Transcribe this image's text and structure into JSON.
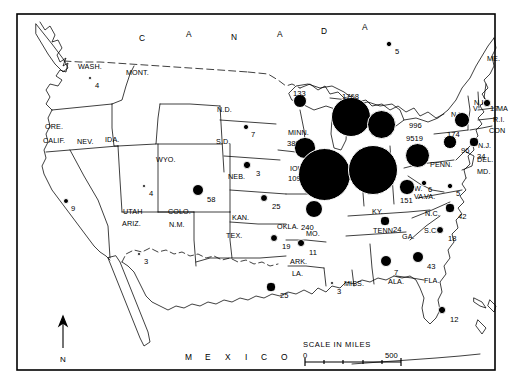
{
  "figure": {
    "border_color": "#000000",
    "dot_color": "#000000",
    "background": "#ffffff"
  },
  "country_labels": [
    {
      "text": "C",
      "x": 139,
      "y": 33
    },
    {
      "text": "A",
      "x": 186,
      "y": 29
    },
    {
      "text": "N",
      "x": 231,
      "y": 32
    },
    {
      "text": "A",
      "x": 277,
      "y": 29
    },
    {
      "text": "D",
      "x": 321,
      "y": 26
    },
    {
      "text": "A",
      "x": 362,
      "y": 22
    },
    {
      "text": "M",
      "x": 185,
      "y": 352
    },
    {
      "text": "E",
      "x": 205,
      "y": 352
    },
    {
      "text": "X",
      "x": 225,
      "y": 352
    },
    {
      "text": "I",
      "x": 245,
      "y": 352
    },
    {
      "text": "C",
      "x": 261,
      "y": 352
    },
    {
      "text": "O",
      "x": 281,
      "y": 352
    }
  ],
  "state_labels": [
    {
      "name": "WASH.",
      "text": "WASH.",
      "x": 78,
      "y": 62
    },
    {
      "name": "MONT.",
      "text": "MONT.",
      "x": 126,
      "y": 68
    },
    {
      "name": "ORE.",
      "text": "ORE.",
      "x": 45,
      "y": 122
    },
    {
      "name": "IDA.",
      "text": "IDA.",
      "x": 105,
      "y": 135
    },
    {
      "name": "CALIF.",
      "text": "CALIF.",
      "x": 43,
      "y": 136
    },
    {
      "name": "NEV.",
      "text": "NEV.",
      "x": 77,
      "y": 137
    },
    {
      "name": "WYO.",
      "text": "WYO.",
      "x": 156,
      "y": 155
    },
    {
      "name": "N.D.",
      "text": "N.D.",
      "x": 217,
      "y": 105
    },
    {
      "name": "S.D.",
      "text": "S.D.",
      "x": 216,
      "y": 137
    },
    {
      "name": "NEB.",
      "text": "NEB.",
      "x": 228,
      "y": 172
    },
    {
      "name": "UTAH",
      "text": "UTAH",
      "x": 123,
      "y": 207
    },
    {
      "name": "ARIZ.",
      "text": "ARIZ.",
      "x": 122,
      "y": 219
    },
    {
      "name": "COLO.",
      "text": "COLO.",
      "x": 168,
      "y": 207
    },
    {
      "name": "N.M.",
      "text": "N.M.",
      "x": 169,
      "y": 220
    },
    {
      "name": "KAN.",
      "text": "KAN.",
      "x": 232,
      "y": 213
    },
    {
      "name": "TEX.",
      "text": "TEX.",
      "x": 226,
      "y": 231
    },
    {
      "name": "OKLA.",
      "text": "OKLA.",
      "x": 277,
      "y": 222
    },
    {
      "name": "ARK.",
      "text": "ARK.",
      "x": 290,
      "y": 257
    },
    {
      "name": "LA.",
      "text": "LA.",
      "x": 292,
      "y": 269
    },
    {
      "name": "MISS.",
      "text": "MISS.",
      "x": 344,
      "y": 279
    },
    {
      "name": "ALA.",
      "text": "ALA.",
      "x": 388,
      "y": 277
    },
    {
      "name": "MO.",
      "text": "MO.",
      "x": 306,
      "y": 229
    },
    {
      "name": "MINN.",
      "text": "MINN.",
      "x": 288,
      "y": 128
    },
    {
      "name": "IOWA",
      "text": "IOWA",
      "x": 290,
      "y": 164
    },
    {
      "name": "TENN.",
      "text": "TENN.",
      "x": 373,
      "y": 226
    },
    {
      "name": "KY.",
      "text": "KY.",
      "x": 372,
      "y": 207
    },
    {
      "name": "GA.",
      "text": "GA.",
      "x": 402,
      "y": 232
    },
    {
      "name": "FLA.",
      "text": "FLA.",
      "x": 424,
      "y": 276
    },
    {
      "name": "S.C.",
      "text": "S.C.",
      "x": 424,
      "y": 226
    },
    {
      "name": "N.C.",
      "text": "N.C.",
      "x": 425,
      "y": 209
    },
    {
      "name": "VA.",
      "text": "VA.",
      "x": 424,
      "y": 192
    },
    {
      "name": "W.VA-W",
      "text": "W.",
      "x": 414,
      "y": 184
    },
    {
      "name": "W.VA-VA",
      "text": "VA.",
      "x": 414,
      "y": 192
    },
    {
      "name": "PENN.",
      "text": "PENN.",
      "x": 430,
      "y": 160
    },
    {
      "name": "N.Y.",
      "text": "N.Y.",
      "x": 451,
      "y": 110
    },
    {
      "name": "N.H.",
      "text": "N.H.",
      "x": 474,
      "y": 98
    },
    {
      "name": "MASS.",
      "text": "MA",
      "x": 497,
      "y": 104
    },
    {
      "name": "R.I.",
      "text": "R.I.",
      "x": 493,
      "y": 115
    },
    {
      "name": "CONN.",
      "text": "CON",
      "x": 489,
      "y": 126
    },
    {
      "name": "N.J.",
      "text": "N.J.",
      "x": 478,
      "y": 141
    },
    {
      "name": "DEL.",
      "text": "DEL.",
      "x": 477,
      "y": 155
    },
    {
      "name": "MD.",
      "text": "MD.",
      "x": 477,
      "y": 167
    },
    {
      "name": "VT.",
      "text": "V",
      "x": 473,
      "y": 104
    },
    {
      "name": "ME.",
      "text": "ME.",
      "x": 487,
      "y": 54
    }
  ],
  "data_points": [
    {
      "state": "WASH.",
      "value": 4,
      "cx": 90,
      "cy": 78,
      "r": 2.4,
      "lx": 95,
      "ly": 81
    },
    {
      "state": "CALIF.",
      "value": 9,
      "cx": 66,
      "cy": 201,
      "r": 3.0,
      "lx": 71,
      "ly": 204
    },
    {
      "state": "IDA.",
      "value": 4,
      "cx": 144,
      "cy": 186,
      "r": 2.4,
      "lx": 149,
      "ly": 189
    },
    {
      "state": "ARIZ.",
      "value": 3,
      "cx": 139,
      "cy": 254,
      "r": 2.2,
      "lx": 144,
      "ly": 257
    },
    {
      "state": "COLO.",
      "value": 58,
      "cx": 198,
      "cy": 190,
      "r": 6.4,
      "lx": 207,
      "ly": 195
    },
    {
      "state": "S.D.",
      "value": 7,
      "cx": 246,
      "cy": 127,
      "r": 2.8,
      "lx": 251,
      "ly": 130
    },
    {
      "state": "NEB.",
      "value": 3,
      "cx": 247,
      "cy": 165,
      "r": 3.6,
      "lx": 256,
      "ly": 169
    },
    {
      "state": "KAN.",
      "value": 25,
      "cx": 264,
      "cy": 198,
      "r": 4.4,
      "lx": 272,
      "ly": 202
    },
    {
      "state": "OKLA.",
      "value": 19,
      "cx": 274,
      "cy": 238,
      "r": 4.0,
      "lx": 282,
      "ly": 242
    },
    {
      "state": "TEX.",
      "value": 25,
      "cx": 271,
      "cy": 287,
      "r": 4.6,
      "lx": 280,
      "ly": 291
    },
    {
      "state": "ARK.",
      "value": 11,
      "cx": 301,
      "cy": 243,
      "r": 3.8,
      "lx": 309,
      "ly": 248
    },
    {
      "state": "MISS.",
      "value": 3,
      "cx": 332,
      "cy": 283,
      "r": 2.2,
      "lx": 337,
      "ly": 287
    },
    {
      "state": "ALA.",
      "value": 7,
      "cx": 386,
      "cy": 261,
      "r": 6.0,
      "lx": 394,
      "ly": 268
    },
    {
      "state": "GA.",
      "value": 43,
      "cx": 418,
      "cy": 257,
      "r": 6.2,
      "lx": 427,
      "ly": 262
    },
    {
      "state": "S.C.",
      "value": 18,
      "cx": 440,
      "cy": 230,
      "r": 4.4,
      "lx": 448,
      "ly": 234
    },
    {
      "state": "N.C.",
      "value": 42,
      "cx": 450,
      "cy": 208,
      "r": 4.6,
      "lx": 458,
      "ly": 212
    },
    {
      "state": "FLA.",
      "value": 12,
      "cx": 442,
      "cy": 310,
      "r": 3.6,
      "lx": 450,
      "ly": 315
    },
    {
      "state": "TENN.",
      "value": 24,
      "cx": 385,
      "cy": 221,
      "r": 4.6,
      "lx": 393,
      "ly": 225
    },
    {
      "state": "MO.",
      "value": 240,
      "cx": 314,
      "cy": 209,
      "r": 9.0,
      "lx": 301,
      "ly": 223
    },
    {
      "state": "MINN.",
      "value": 389,
      "cx": 305,
      "cy": 148,
      "r": 10.6,
      "lx": 287,
      "ly": 139
    },
    {
      "state": "IOWA",
      "value": 10994,
      "cx": 324,
      "cy": 174,
      "r": 26.5,
      "lx": 288,
      "ly": 174
    },
    {
      "state": "WIS-N",
      "value": 133,
      "cx": 300,
      "cy": 101,
      "r": 7.2,
      "lx": 293,
      "ly": 89
    },
    {
      "state": "WIS",
      "value": 1768,
      "cx": 351,
      "cy": 117,
      "r": 20.0,
      "lx": 342,
      "ly": 92
    },
    {
      "state": "MICH",
      "value": 996,
      "cx": 381,
      "cy": 124,
      "r": 14.5,
      "lx": 409,
      "ly": 121
    },
    {
      "state": "OHIO",
      "value": 9519,
      "cx": 373,
      "cy": 170,
      "r": 25.0,
      "lx": 406,
      "ly": 134
    },
    {
      "state": "IND",
      "value": 741,
      "cx": 417,
      "cy": 155,
      "r": 12.5,
      "lx": 412,
      "ly": 145
    },
    {
      "state": "KY.",
      "value": 151,
      "cx": 407,
      "cy": 187,
      "r": 7.6,
      "lx": 400,
      "ly": 196
    },
    {
      "state": "W.VA.",
      "value": 6,
      "cx": 424,
      "cy": 183,
      "r": 2.6,
      "lx": 428,
      "ly": 185
    },
    {
      "state": "VA.",
      "value": 5,
      "cx": 450,
      "cy": 186,
      "r": 2.6,
      "lx": 456,
      "ly": 189
    },
    {
      "state": "PENN.",
      "value": 96,
      "cx": 450,
      "cy": 142,
      "r": 6.6,
      "lx": 461,
      "ly": 146
    },
    {
      "state": "N.Y.",
      "value": 174,
      "cx": 462,
      "cy": 120,
      "r": 7.8,
      "lx": 447,
      "ly": 130
    },
    {
      "state": "N.J.",
      "value": 34,
      "cx": 474,
      "cy": 142,
      "r": 4.6,
      "lx": 477,
      "ly": 152
    },
    {
      "state": "MASS.",
      "value": 17,
      "cx": 487,
      "cy": 103,
      "r": 3.6,
      "lx": 490,
      "ly": 104
    },
    {
      "state": "ONTARIO",
      "value": 5,
      "cx": 389,
      "cy": 44,
      "r": 2.6,
      "lx": 395,
      "ly": 47
    }
  ],
  "scale": {
    "title": "SCALE IN MILES",
    "min_label": "0",
    "max_label": "500",
    "x": 303,
    "y": 340,
    "bar_width": 96,
    "ticks": 5
  },
  "north_arrow": {
    "letter": "N",
    "x": 60,
    "y": 318
  }
}
